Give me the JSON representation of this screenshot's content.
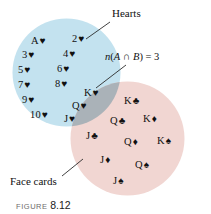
{
  "figure": {
    "caption_word": "FIGURE",
    "caption_number": "8.12"
  },
  "diagram": {
    "type": "venn-diagram",
    "sets": {
      "hearts": {
        "label": "Hearts",
        "fill_color": "#c3e2ef",
        "cards": [
          {
            "rank": "A",
            "suit": "♥",
            "x": 31,
            "y": 36
          },
          {
            "rank": "2",
            "suit": "♥",
            "x": 72,
            "y": 34
          },
          {
            "rank": "3",
            "suit": "♥",
            "x": 22,
            "y": 50
          },
          {
            "rank": "4",
            "suit": "♥",
            "x": 63,
            "y": 49
          },
          {
            "rank": "5",
            "suit": "♥",
            "x": 18,
            "y": 65
          },
          {
            "rank": "6",
            "suit": "♥",
            "x": 57,
            "y": 64
          },
          {
            "rank": "7",
            "suit": "♥",
            "x": 18,
            "y": 80
          },
          {
            "rank": "8",
            "suit": "♥",
            "x": 55,
            "y": 79
          },
          {
            "rank": "9",
            "suit": "♥",
            "x": 22,
            "y": 95
          },
          {
            "rank": "10",
            "suit": "♥",
            "x": 30,
            "y": 110
          }
        ]
      },
      "face_cards": {
        "label": "Face cards",
        "fill_color": "#f1d6d2",
        "cards": [
          {
            "rank": "K",
            "suit": "♣",
            "x": 124,
            "y": 96
          },
          {
            "rank": "Q",
            "suit": "♣",
            "x": 110,
            "y": 116
          },
          {
            "rank": "K",
            "suit": "♦",
            "x": 143,
            "y": 114
          },
          {
            "rank": "J",
            "suit": "♣",
            "x": 86,
            "y": 131
          },
          {
            "rank": "Q",
            "suit": "♦",
            "x": 124,
            "y": 137
          },
          {
            "rank": "K",
            "suit": "♠",
            "x": 157,
            "y": 136
          },
          {
            "rank": "J",
            "suit": "♦",
            "x": 100,
            "y": 155
          },
          {
            "rank": "Q",
            "suit": "♠",
            "x": 135,
            "y": 160
          },
          {
            "rank": "J",
            "suit": "♠",
            "x": 113,
            "y": 176
          }
        ]
      },
      "intersection": {
        "fill_color": "#aab2b8",
        "annotation": "n(A ∩ B) = 3",
        "annotation_parts": {
          "n": "n",
          "open": "(",
          "a": "A",
          "cap": " ∩ ",
          "b": "B",
          "close": ")",
          "equals": " = ",
          "count": "3"
        },
        "count": 3,
        "cards": [
          {
            "rank": "K",
            "suit": "♥",
            "x": 84,
            "y": 88
          },
          {
            "rank": "Q",
            "suit": "♥",
            "x": 72,
            "y": 101
          },
          {
            "rank": "J",
            "suit": "♥",
            "x": 64,
            "y": 114
          }
        ]
      }
    }
  }
}
